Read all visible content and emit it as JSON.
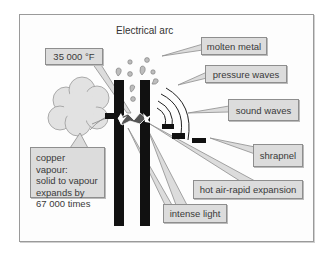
{
  "title": "Electrical arc",
  "labels": {
    "temperature": "35 000 °F",
    "molten_metal": "molten metal",
    "pressure_waves": "pressure waves",
    "sound_waves": "sound waves",
    "shrapnel": "shrapnel",
    "hot_air": "hot air-rapid expansion",
    "intense_light": "intense light",
    "copper_vapour": {
      "line1": "copper vapour:",
      "line2": "solid to vapour",
      "line3": "expands by",
      "line4": "67 000 times"
    }
  },
  "colors": {
    "label_fill": "#dcdcdc",
    "label_border": "#8e8e8e",
    "electrode": "#111111",
    "cloud": "#e2e2e2",
    "frame": "#9a9a9a"
  }
}
